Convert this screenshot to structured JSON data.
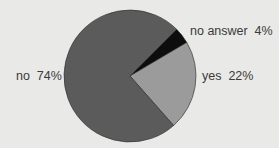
{
  "chart_data": {
    "type": "pie",
    "title": "",
    "start_angle_deg": 45,
    "direction": "clockwise",
    "slices": [
      {
        "label": "no answer",
        "value": 4,
        "display": "no answer  4%",
        "color": "#0d0d0d"
      },
      {
        "label": "yes",
        "value": 22,
        "display": "yes  22%",
        "color": "#9b9b9b"
      },
      {
        "label": "no",
        "value": 74,
        "display": "no  74%",
        "color": "#5b5b5b"
      }
    ],
    "legend": "none",
    "labels_placement": "outside"
  }
}
